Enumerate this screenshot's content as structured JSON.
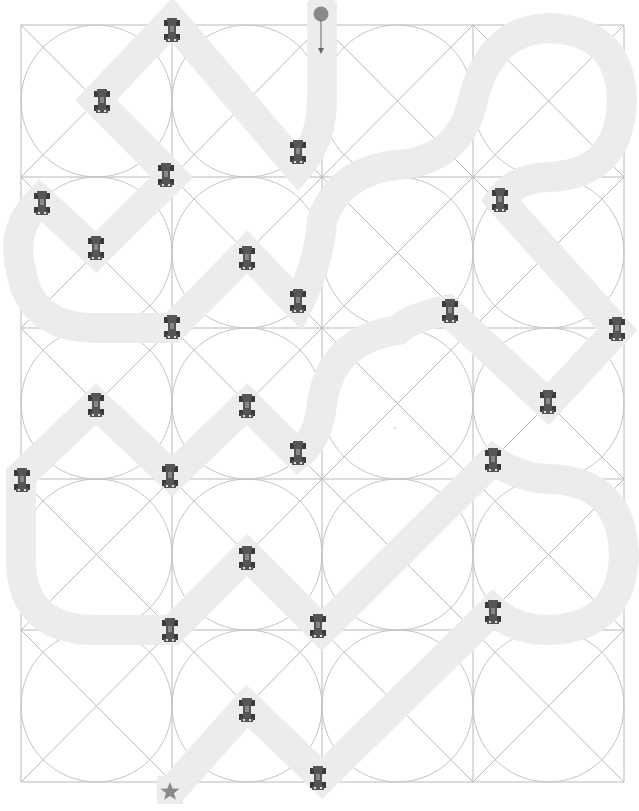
{
  "board": {
    "columns": 4,
    "rows": 5,
    "col_lines": [
      21,
      172,
      322,
      473,
      624
    ],
    "row_lines": [
      25,
      177,
      328,
      479,
      630,
      782
    ],
    "colors": {
      "grid": "#b9b9b9",
      "track": "#ececec",
      "car": "#555555",
      "start_marker": "#8a8a8a",
      "finish_marker": "#8a8a8a"
    }
  },
  "start": {
    "x": 321,
    "y": 14,
    "icon": "circle-start-icon",
    "arrow": "arrow-down-icon"
  },
  "finish": {
    "x": 172,
    "y": 792,
    "icon": "star-finish-icon"
  },
  "track_path": "M322,2 L322,100 Q322,140 298,168 L298,168 L172,20 L96,100 L172,177 L96,252 L40,200 Q10,230 21,270 Q30,328 96,328 L172,328 L247,252 L298,305 Q320,260 322,220 Q340,170 398,165 Q460,160 473,100 Q490,30 548,28 Q620,30 622,100 Q620,175 548,177 Q515,178 500,200 L617,330 L548,404 L447,310 Q410,318 398,330 Q330,340 322,404 Q318,440 298,455 L247,404 L172,476 L96,404 L21,476 L21,560 Q21,630 96,630 L172,630 L247,555 L322,630 L493,460 Q520,478 548,479 Q622,480 624,555 Q622,628 548,630 Q515,630 493,610 L322,778 L247,706 L172,790",
  "cars": [
    {
      "x": 172,
      "y": 30
    },
    {
      "x": 102,
      "y": 101
    },
    {
      "x": 298,
      "y": 152
    },
    {
      "x": 166,
      "y": 175
    },
    {
      "x": 42,
      "y": 203
    },
    {
      "x": 96,
      "y": 248
    },
    {
      "x": 247,
      "y": 258
    },
    {
      "x": 298,
      "y": 301
    },
    {
      "x": 172,
      "y": 327
    },
    {
      "x": 500,
      "y": 200
    },
    {
      "x": 450,
      "y": 311
    },
    {
      "x": 617,
      "y": 329
    },
    {
      "x": 548,
      "y": 402
    },
    {
      "x": 96,
      "y": 405
    },
    {
      "x": 247,
      "y": 406
    },
    {
      "x": 298,
      "y": 453
    },
    {
      "x": 22,
      "y": 480
    },
    {
      "x": 170,
      "y": 476
    },
    {
      "x": 493,
      "y": 460
    },
    {
      "x": 247,
      "y": 558
    },
    {
      "x": 170,
      "y": 630
    },
    {
      "x": 318,
      "y": 626
    },
    {
      "x": 493,
      "y": 612
    },
    {
      "x": 247,
      "y": 710
    },
    {
      "x": 318,
      "y": 778
    }
  ],
  "faint_dot": {
    "x": 395,
    "y": 428
  }
}
